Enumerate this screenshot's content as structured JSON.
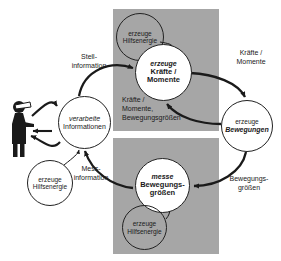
{
  "diagram": {
    "blocks": {
      "actuator": {
        "title": "Aktuator",
        "color": "#a6a6a6"
      },
      "sensor": {
        "title": "Sensor",
        "color": "#a6a6a6"
      }
    },
    "nodes": [
      {
        "id": "aux-top",
        "line1": "erzeuge",
        "line2": "Hilfsenergie",
        "line3": ""
      },
      {
        "id": "kraefte",
        "line1": "erzeuge",
        "line2": "Kräfte /",
        "line3": "Momente"
      },
      {
        "id": "bewegungen",
        "line1": "erzeuge",
        "line2": "Bewegungen",
        "line3": ""
      },
      {
        "id": "messe",
        "line1": "messe",
        "line2": "Bewegungs-",
        "line3": "größen"
      },
      {
        "id": "aux-bottom",
        "line1": "erzeuge",
        "line2": "Hilfsenergie",
        "line3": ""
      },
      {
        "id": "verarbeite",
        "line1": "verarbeite",
        "line2": "Informationen",
        "line3": ""
      },
      {
        "id": "aux-left",
        "line1": "erzeuge",
        "line2": "Hilfsenergie",
        "line3": ""
      }
    ],
    "labels": {
      "stell_information": "Stell-\ninformation",
      "kraefte_momente_r": "Kräfte /\nMomente",
      "mitte": "Kräfte /\nMomente,\nBewegungsgrößen",
      "mess_information": "Mess-\ninformation",
      "bewegungsgroessen_r": "Bewegungs-\ngrößen"
    },
    "person": {
      "name": "Mensch / Bediener"
    },
    "colors": {
      "block_grey": "#a6a6a6",
      "line_black": "#1a1a1a",
      "node_fill": "#ffffff",
      "title_white": "#ffffff",
      "background": "#ffffff"
    }
  }
}
